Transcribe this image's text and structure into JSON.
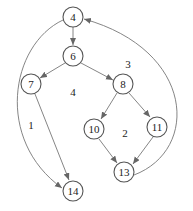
{
  "diagram": {
    "type": "control-flow-graph",
    "nodes": [
      {
        "id": "4",
        "label": "4",
        "x": 73,
        "y": 17
      },
      {
        "id": "6",
        "label": "6",
        "x": 73,
        "y": 56
      },
      {
        "id": "7",
        "label": "7",
        "x": 31,
        "y": 84
      },
      {
        "id": "8",
        "label": "8",
        "x": 123,
        "y": 84
      },
      {
        "id": "10",
        "label": "10",
        "x": 94,
        "y": 129
      },
      {
        "id": "11",
        "label": "11",
        "x": 157,
        "y": 127
      },
      {
        "id": "13",
        "label": "13",
        "x": 124,
        "y": 172
      },
      {
        "id": "14",
        "label": "14",
        "x": 73,
        "y": 191
      }
    ],
    "edges": [
      {
        "from": "4",
        "to": "6"
      },
      {
        "from": "6",
        "to": "7"
      },
      {
        "from": "6",
        "to": "8"
      },
      {
        "from": "7",
        "to": "14"
      },
      {
        "from": "8",
        "to": "10"
      },
      {
        "from": "8",
        "to": "11"
      },
      {
        "from": "10",
        "to": "13"
      },
      {
        "from": "11",
        "to": "13"
      },
      {
        "from": "4",
        "to": "14",
        "curved": true
      },
      {
        "from": "13",
        "to": "4",
        "curved": true
      }
    ],
    "regions": [
      {
        "label": "1",
        "x": 31,
        "y": 125
      },
      {
        "label": "2",
        "x": 125,
        "y": 133
      },
      {
        "label": "3",
        "x": 128,
        "y": 64
      },
      {
        "label": "4",
        "x": 73,
        "y": 92
      }
    ]
  }
}
